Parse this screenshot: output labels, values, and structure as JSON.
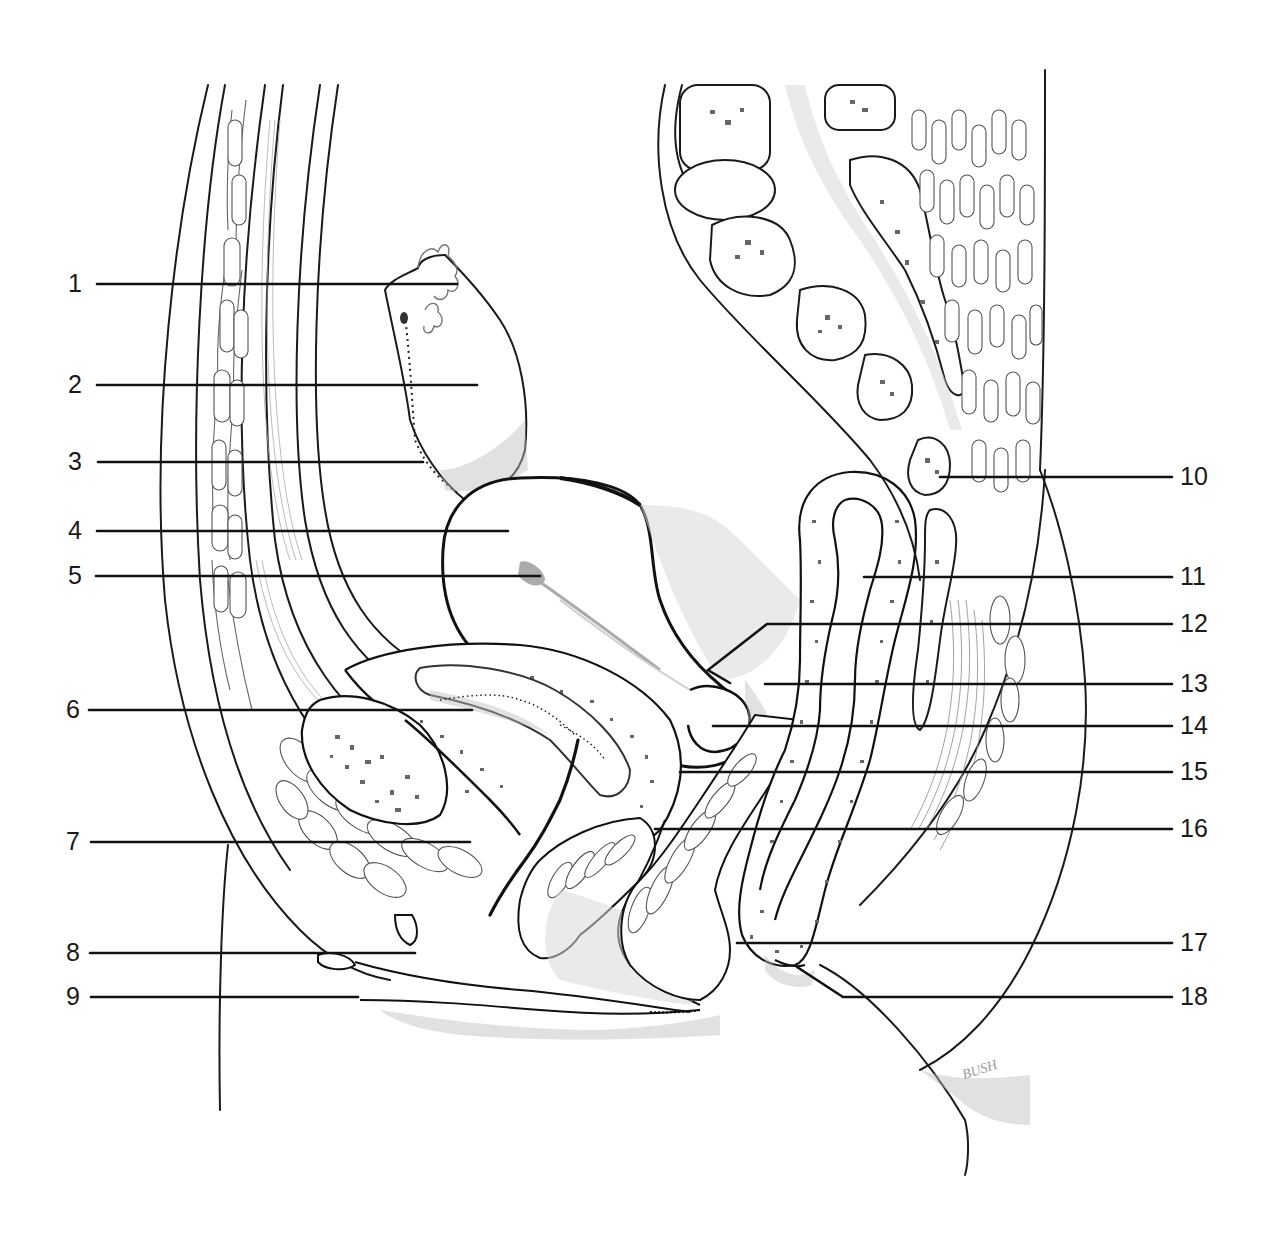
{
  "figure": {
    "type": "anatomical line illustration, sagittal section of female pelvis",
    "signature": "BUSH",
    "background_color": "#ffffff",
    "line_color": "#1a1a1a"
  },
  "labels": {
    "left": [
      {
        "num": "1",
        "y": 284,
        "x_start": 97,
        "x_end": 457
      },
      {
        "num": "2",
        "y": 385,
        "x_start": 97,
        "x_end": 477
      },
      {
        "num": "3",
        "y": 462,
        "x_start": 98,
        "x_end": 423
      },
      {
        "num": "4",
        "y": 531,
        "x_start": 97,
        "x_end": 508
      },
      {
        "num": "5",
        "y": 576,
        "x_start": 96,
        "x_end": 540
      },
      {
        "num": "6",
        "y": 710,
        "x_start": 89,
        "x_end": 472
      },
      {
        "num": "7",
        "y": 842,
        "x_start": 91,
        "x_end": 470
      },
      {
        "num": "8",
        "y": 953,
        "x_start": 90,
        "x_end": 415
      },
      {
        "num": "9",
        "y": 997,
        "x_start": 91,
        "x_end": 358
      }
    ],
    "right": [
      {
        "num": "10",
        "y": 477,
        "x_start": 940,
        "x_end": 1172
      },
      {
        "num": "11",
        "y": 577,
        "x_start": 864,
        "x_end": 1172
      },
      {
        "num": "12",
        "y": 624,
        "x_start": 720,
        "x_end": 1172
      },
      {
        "num": "13",
        "y": 684,
        "x_start": 765,
        "x_end": 1172
      },
      {
        "num": "14",
        "y": 726,
        "x_start": 713,
        "x_end": 1172
      },
      {
        "num": "15",
        "y": 772,
        "x_start": 680,
        "x_end": 1172
      },
      {
        "num": "16",
        "y": 829,
        "x_start": 655,
        "x_end": 1172
      },
      {
        "num": "17",
        "y": 943,
        "x_start": 737,
        "x_end": 1172
      },
      {
        "num": "18",
        "y": 997,
        "x_start": 797,
        "x_end": 1172
      }
    ]
  }
}
